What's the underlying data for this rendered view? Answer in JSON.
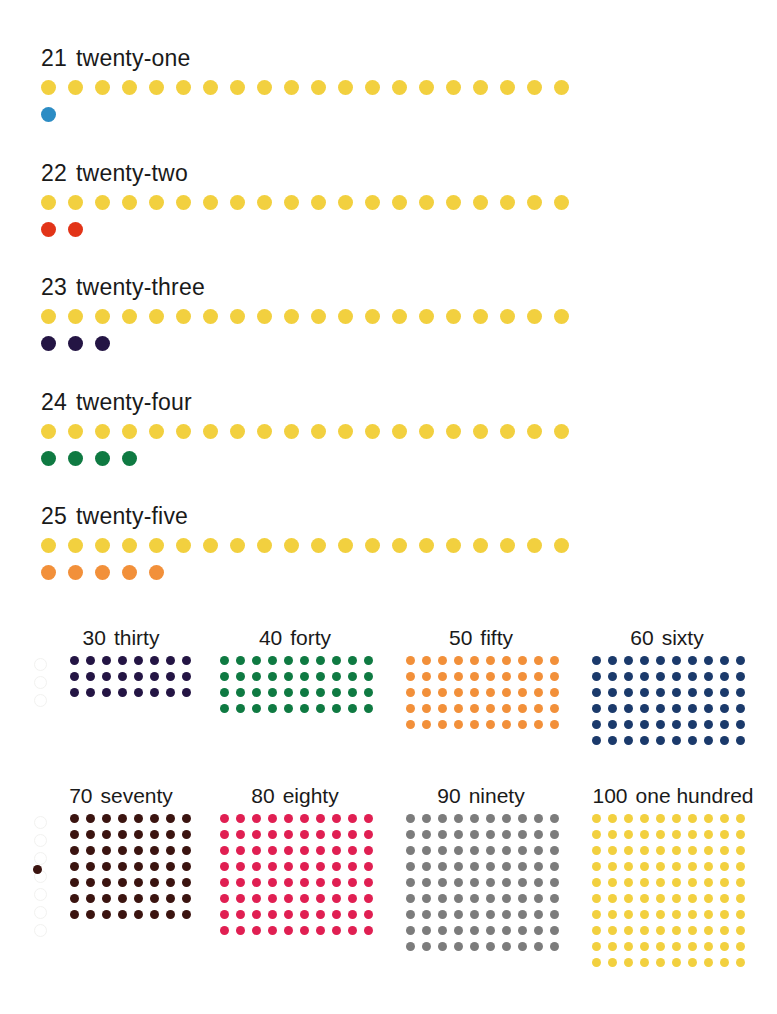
{
  "page": {
    "background": "#ffffff"
  },
  "palette": {
    "yellow": "#F2D03F",
    "yellow_light": "#F5DB55",
    "blue": "#2C8CC4",
    "red": "#E23418",
    "indigo": "#241544",
    "green": "#0F7A42",
    "orange": "#F2903A",
    "navy": "#1B3A6B",
    "brown": "#3B1410",
    "crimson": "#E01F52",
    "gray": "#7C7C7C"
  },
  "teens": [
    {
      "number": "21",
      "word": "twenty-one",
      "base_count": 20,
      "base_color": "#F2D03F",
      "extra_count": 1,
      "extra_color": "#2C8CC4",
      "extra_color_name": "blue",
      "top": 45
    },
    {
      "number": "22",
      "word": "twenty-two",
      "base_count": 20,
      "base_color": "#F2D03F",
      "extra_count": 2,
      "extra_color": "#E23418",
      "extra_color_name": "red",
      "top": 160
    },
    {
      "number": "23",
      "word": "twenty-three",
      "base_count": 20,
      "base_color": "#F2D03F",
      "extra_count": 3,
      "extra_color": "#241544",
      "extra_color_name": "indigo",
      "top": 274
    },
    {
      "number": "24",
      "word": "twenty-four",
      "base_count": 20,
      "base_color": "#F2D03F",
      "extra_count": 4,
      "extra_color": "#0F7A42",
      "extra_color_name": "green",
      "top": 389
    },
    {
      "number": "25",
      "word": "twenty-five",
      "base_count": 20,
      "base_color": "#F2D03F",
      "extra_count": 5,
      "extra_color": "#F2903A",
      "extra_color_name": "orange",
      "top": 503
    }
  ],
  "tens": [
    {
      "number": "30",
      "word": "thirty",
      "color": "#241544",
      "color_name": "indigo",
      "cols": 8,
      "rows": 3,
      "stray": 0,
      "left": 32,
      "top": 14,
      "label_width": 178,
      "grid_left": 38,
      "ghosts": 3
    },
    {
      "number": "40",
      "word": "forty",
      "color": "#0F7A42",
      "color_name": "green",
      "cols": 10,
      "rows": 4,
      "stray": 0,
      "left": 206,
      "top": 14,
      "label_width": 178,
      "grid_left": 14,
      "ghosts": 0
    },
    {
      "number": "50",
      "word": "fifty",
      "color": "#F2903A",
      "color_name": "orange",
      "cols": 10,
      "rows": 5,
      "stray": 0,
      "left": 392,
      "top": 14,
      "label_width": 178,
      "grid_left": 14,
      "ghosts": 0
    },
    {
      "number": "60",
      "word": "sixty",
      "color": "#1B3A6B",
      "color_name": "navy",
      "cols": 10,
      "rows": 6,
      "stray": 0,
      "left": 578,
      "top": 14,
      "label_width": 178,
      "grid_left": 14,
      "ghosts": 0
    },
    {
      "number": "70",
      "word": "seventy",
      "color": "#3B1410",
      "color_name": "brown",
      "cols": 8,
      "rows": 7,
      "stray": 1,
      "stray_row": 4,
      "left": 32,
      "top": 172,
      "label_width": 178,
      "grid_left": 38,
      "ghosts": 7
    },
    {
      "number": "80",
      "word": "eighty",
      "color": "#E01F52",
      "color_name": "crimson",
      "cols": 10,
      "rows": 8,
      "stray": 0,
      "left": 206,
      "top": 172,
      "label_width": 178,
      "grid_left": 14,
      "ghosts": 0
    },
    {
      "number": "90",
      "word": "ninety",
      "color": "#7C7C7C",
      "color_name": "gray",
      "cols": 10,
      "rows": 9,
      "stray": 0,
      "left": 392,
      "top": 172,
      "label_width": 178,
      "grid_left": 14,
      "ghosts": 0
    },
    {
      "number": "100",
      "word": "one hundred",
      "color": "#F2D03F",
      "color_name": "yellow",
      "cols": 10,
      "rows": 10,
      "stray": 0,
      "left": 578,
      "top": 172,
      "label_width": 190,
      "grid_left": 14,
      "ghosts": 0
    }
  ]
}
